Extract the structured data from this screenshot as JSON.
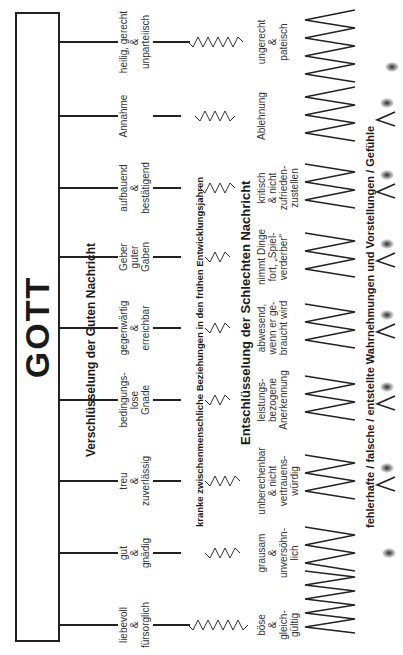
{
  "god": {
    "title": "GOTT"
  },
  "headings": {
    "good_news": "Verschlüsselung der Guten Nachricht",
    "relationships": "kranke zwischenmenschliche Beziehungen in den frühen Entwicklungsjahren",
    "bad_news": "Entschlüsselung der Schlechten Nachricht",
    "perceptions": "fehlerhafte / falsche / entstellte Wahrnehmungen und Vorstellungen / Gefühle"
  },
  "columns": [
    {
      "good": [
        "liebevoll",
        "&",
        "fürsorglich"
      ],
      "bad": [
        "böse",
        "&",
        "gleich-",
        "gültig"
      ]
    },
    {
      "good": [
        "gut",
        "&",
        "gnädig"
      ],
      "bad": [
        "grausam",
        "&",
        "unversöhn-",
        "lich"
      ]
    },
    {
      "good": [
        "treu",
        "&",
        "zuverlässig"
      ],
      "bad": [
        "unberechenbar",
        "& nicht",
        "vertrauens-",
        "würdig"
      ]
    },
    {
      "good": [
        "bedingungs-",
        "lose",
        "Gnade"
      ],
      "bad": [
        "leistungs-",
        "bezogene",
        "Anerkennung"
      ]
    },
    {
      "good": [
        "gegenwärtig",
        "&",
        "erreichbar"
      ],
      "bad": [
        "abwesend,",
        "wenn er ge-",
        "braucht wird"
      ]
    },
    {
      "good": [
        "Geber",
        "guter",
        "Gaben"
      ],
      "bad": [
        "nimmt Dinge",
        "fort, „Spiel-",
        "verderber\""
      ]
    },
    {
      "good": [
        "aufbauend",
        "&",
        "bestätigend"
      ],
      "bad": [
        "kritisch",
        "& nicht",
        "zufrieden-",
        "zustellen"
      ]
    },
    {
      "good": [
        "Annahme"
      ],
      "bad": [
        "Ablehnung"
      ]
    },
    {
      "good": [
        "heilig, gerecht",
        "&",
        "unparteiisch"
      ],
      "bad": [
        "ungerecht",
        "&",
        "pateisch"
      ]
    }
  ]
}
